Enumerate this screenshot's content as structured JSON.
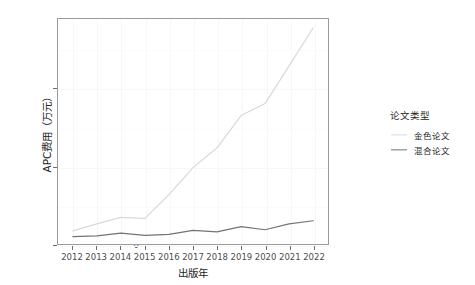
{
  "chart_data": {
    "type": "line",
    "title": "",
    "xlabel": "出版年",
    "ylabel": "APC费用（万元）",
    "x": [
      2012,
      2013,
      2014,
      2015,
      2016,
      2017,
      2018,
      2019,
      2020,
      2021,
      2022
    ],
    "xtick_labels": [
      "2012",
      "2013",
      "2014",
      "2015",
      "2016",
      "2017",
      "2018",
      "2019",
      "2020",
      "2021",
      "2022"
    ],
    "ytick_labels": [
      "0",
      "500",
      "1000"
    ],
    "ytick_values": [
      0,
      500,
      1000
    ],
    "xlim": [
      2012,
      2022
    ],
    "ylim": [
      0,
      1450
    ],
    "grid": true,
    "legend_position": "right",
    "legend_title": "论文类型",
    "series": [
      {
        "name": "金色论文",
        "color": "#d9d9d9",
        "values": [
          85,
          130,
          172,
          165,
          318,
          492,
          620,
          828,
          905,
          1148,
          1392
        ]
      },
      {
        "name": "混合论文",
        "color": "#737373",
        "values": [
          48,
          52,
          70,
          56,
          62,
          88,
          78,
          112,
          92,
          130,
          150
        ]
      }
    ]
  },
  "axes": {
    "y_title": "APC费用（万元）",
    "x_title": "出版年"
  },
  "legend": {
    "title": "论文类型",
    "items": [
      {
        "label": "金色论文",
        "color": "#d9d9d9"
      },
      {
        "label": "混合论文",
        "color": "#737373"
      }
    ]
  },
  "colors": {
    "panel_border": "#9a9a9a",
    "gridline": "#f7f7f7",
    "axis_text": "#4d4d4d",
    "title_text": "#242424",
    "background": "#ffffff"
  }
}
